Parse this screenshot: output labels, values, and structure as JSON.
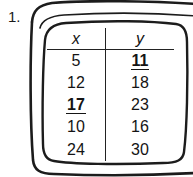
{
  "problem": {
    "number_label": "1."
  },
  "table": {
    "headers": [
      {
        "label": "x",
        "name": "column-header-x"
      },
      {
        "label": "y",
        "name": "column-header-y"
      }
    ],
    "rows": [
      {
        "x": "5",
        "y": "11",
        "x_highlight": false,
        "y_highlight": true
      },
      {
        "x": "12",
        "y": "18",
        "x_highlight": false,
        "y_highlight": false
      },
      {
        "x": "17",
        "y": "23",
        "x_highlight": true,
        "y_highlight": false
      },
      {
        "x": "10",
        "y": "16",
        "x_highlight": false,
        "y_highlight": false
      },
      {
        "x": "24",
        "y": "30",
        "x_highlight": false,
        "y_highlight": false
      }
    ]
  },
  "style": {
    "ink_color": "#141414",
    "page_color": "#ffffff"
  }
}
